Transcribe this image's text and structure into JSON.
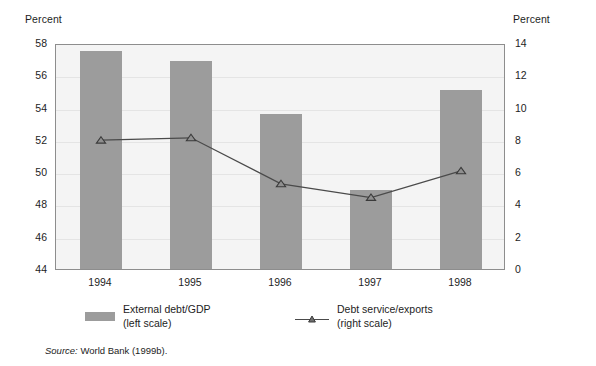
{
  "axis_titles": {
    "left": "Percent",
    "right": "Percent"
  },
  "source": {
    "label": "Source:",
    "text": "World Bank (1999b)."
  },
  "legend": {
    "bars": {
      "line1": "External debt/GDP",
      "line2": "(left scale)"
    },
    "line": {
      "line1": "Debt service/exports",
      "line2": "(right scale)"
    }
  },
  "colors": {
    "bar_fill": "#9c9c9c",
    "line_stroke": "#4a4a4a",
    "plot_background": "#f4f4f4",
    "frame": "#8d8d8d",
    "gridline": "#e4e4e4"
  },
  "chart_data": {
    "type": "bar",
    "title": "",
    "xlabel": "",
    "categories": [
      "1994",
      "1995",
      "1996",
      "1997",
      "1998"
    ],
    "grid": true,
    "legend_position": "bottom",
    "left_axis": {
      "label": "Percent",
      "ylim": [
        44,
        58
      ],
      "ticks": [
        44,
        46,
        48,
        50,
        52,
        54,
        56,
        58
      ]
    },
    "right_axis": {
      "label": "Percent",
      "ylim": [
        0,
        14
      ],
      "ticks": [
        0,
        2,
        4,
        6,
        8,
        10,
        12,
        14
      ]
    },
    "series": [
      {
        "name": "External debt/GDP (left scale)",
        "type": "bar",
        "axis": "left",
        "values": [
          57.5,
          56.9,
          53.6,
          48.9,
          55.1
        ]
      },
      {
        "name": "Debt service/exports (right scale)",
        "type": "line",
        "axis": "right",
        "marker": "triangle",
        "values": [
          8.1,
          8.25,
          5.4,
          4.55,
          6.2
        ]
      }
    ]
  }
}
